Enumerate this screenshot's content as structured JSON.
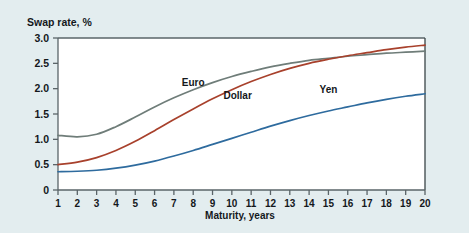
{
  "chart_data": {
    "type": "line",
    "title": "Swap rate, %",
    "xlabel": "Maturity, years",
    "ylabel": "Swap rate, %",
    "xlim": [
      1,
      20
    ],
    "ylim": [
      0,
      3.0
    ],
    "grid": false,
    "legend_position": "inline-labels",
    "x": [
      1,
      2,
      3,
      4,
      5,
      6,
      7,
      8,
      9,
      10,
      11,
      12,
      13,
      14,
      15,
      16,
      17,
      18,
      19,
      20
    ],
    "xticklabels": [
      "1",
      "2",
      "3",
      "4",
      "5",
      "6",
      "7",
      "8",
      "9",
      "10",
      "11",
      "12",
      "13",
      "14",
      "15",
      "16",
      "17",
      "18",
      "19",
      "20"
    ],
    "yticklabels": [
      "0",
      "0.5",
      "1.0",
      "1.5",
      "2.0",
      "2.5",
      "3.0"
    ],
    "ytickvalues": [
      0,
      0.5,
      1.0,
      1.5,
      2.0,
      2.5,
      3.0
    ],
    "series": [
      {
        "name": "Euro",
        "color": "#6f7d79",
        "label_x": 8.0,
        "label_y": 2.06,
        "values": [
          1.08,
          1.05,
          1.1,
          1.25,
          1.44,
          1.64,
          1.82,
          1.98,
          2.12,
          2.24,
          2.34,
          2.43,
          2.5,
          2.56,
          2.6,
          2.64,
          2.67,
          2.7,
          2.72,
          2.74
        ]
      },
      {
        "name": "Dollar",
        "color": "#a8412c",
        "label_x": 10.3,
        "label_y": 1.8,
        "values": [
          0.5,
          0.55,
          0.64,
          0.78,
          0.96,
          1.17,
          1.39,
          1.6,
          1.8,
          1.98,
          2.14,
          2.28,
          2.4,
          2.5,
          2.58,
          2.65,
          2.71,
          2.77,
          2.82,
          2.86
        ]
      },
      {
        "name": "Yen",
        "color": "#2e6b9e",
        "label_x": 15.0,
        "label_y": 1.92,
        "values": [
          0.36,
          0.37,
          0.39,
          0.43,
          0.49,
          0.57,
          0.67,
          0.78,
          0.9,
          1.02,
          1.14,
          1.26,
          1.37,
          1.47,
          1.56,
          1.64,
          1.72,
          1.79,
          1.85,
          1.9
        ]
      }
    ]
  },
  "plot": {
    "frame_color": "#5a6468",
    "background": "#ffffff",
    "page_background": "#e3edef"
  }
}
